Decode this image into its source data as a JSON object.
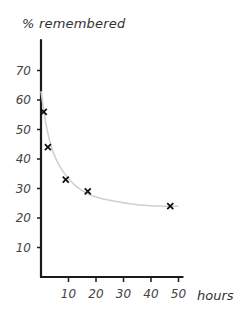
{
  "chart_data": {
    "type": "scatter",
    "title": "",
    "xlabel": "hours",
    "ylabel": "% remembered",
    "xlim": [
      0,
      52
    ],
    "ylim": [
      0,
      75
    ],
    "grid": false,
    "legend": null,
    "x_ticks": [
      10,
      20,
      30,
      40,
      50
    ],
    "y_ticks": [
      10,
      20,
      30,
      40,
      50,
      60,
      70
    ],
    "series": [
      {
        "name": "observations",
        "marker": "x",
        "x": [
          1,
          2.5,
          9,
          17,
          47
        ],
        "y": [
          56,
          44,
          33,
          29,
          24
        ]
      },
      {
        "name": "forgetting curve",
        "style": "smooth-line",
        "color": "#d0d0d0",
        "x": [
          0,
          2,
          5,
          10,
          15,
          20,
          30,
          40,
          50
        ],
        "y": [
          63,
          50,
          40,
          33,
          29,
          27,
          25,
          24,
          24
        ]
      }
    ]
  },
  "labels": {
    "ylabel": "% remembered",
    "xlabel": "hours"
  }
}
